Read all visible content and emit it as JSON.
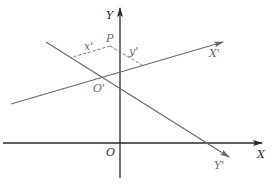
{
  "figure": {
    "type": "coordinate rotation diagram",
    "labels": {
      "x_axis": "X",
      "y_axis": "Y",
      "origin": "O",
      "rotated_x_axis": "X'",
      "rotated_y_axis": "Y'",
      "rotated_origin": "O'",
      "point": "P",
      "x_prime_coord": "x'",
      "y_prime_coord": "y'"
    },
    "colors": {
      "axis": "#2a2a2a",
      "rotated_axis": "#6a6a6a",
      "background": "#ffffff"
    }
  }
}
